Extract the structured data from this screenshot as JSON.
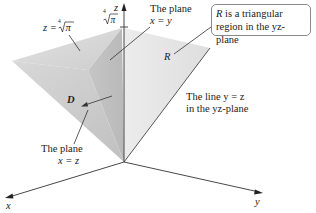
{
  "figure": {
    "axes": {
      "x_label": "x",
      "y_label": "y",
      "z_label": "z",
      "z_tick_label": "⁴√π",
      "z_tick_radicand": "π",
      "z_tick_index": "4"
    },
    "labels": {
      "top_surface": "z = ⁴√π",
      "top_surface_prefix": "z =",
      "top_surface_index": "4",
      "top_surface_radicand": "π",
      "plane_xy_line1": "The plane",
      "plane_xy_line2": "x = y",
      "plane_xz_line1": "The plane",
      "plane_xz_line2": "x = z",
      "region_d": "D",
      "region_r": "R",
      "line_yz_line1": "The line y = z",
      "line_yz_line2": "in the yz-plane"
    },
    "callout": {
      "r_symbol": "R",
      "line1_rest": " is a triangular",
      "line2": "region in the yz-plane"
    },
    "colors": {
      "top_face": "#d4d4d4",
      "plane_xy_face": "#c4c4c4",
      "plane_xz_face": "#cacaca",
      "region_r_face": "#e6e6e6",
      "axis": "#333333",
      "text": "#222222"
    }
  }
}
